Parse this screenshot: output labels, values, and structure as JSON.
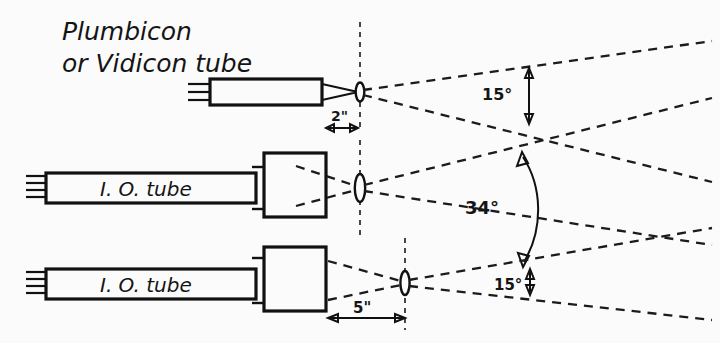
{
  "figure": {
    "type": "optical-ray-diagram",
    "background_color": "#fbfbfb",
    "ink_color": "#111111",
    "title_lines": {
      "line1": "Plumbicon",
      "line2": "or Vidicon tube"
    }
  },
  "labels": {
    "io_tube_middle": "I. O. tube",
    "io_tube_bottom": "I. O. tube"
  },
  "dimensions": [
    {
      "id": "dim-2in",
      "text": "2\"",
      "value": 2,
      "unit": "inch",
      "orientation": "horizontal"
    },
    {
      "id": "dim-5in",
      "text": "5\"",
      "value": 5,
      "unit": "inch",
      "orientation": "horizontal"
    }
  ],
  "angles": [
    {
      "id": "angle-top",
      "text": "15°",
      "value": 15,
      "unit": "degree",
      "arrow": "straight-double"
    },
    {
      "id": "angle-middle",
      "text": "34°",
      "value": 34,
      "unit": "degree",
      "arrow": "curved-double"
    },
    {
      "id": "angle-bottom",
      "text": "15°",
      "value": 15,
      "unit": "degree",
      "arrow": "straight-double"
    }
  ],
  "components": [
    {
      "id": "tube-top",
      "kind": "camera-tube",
      "variant": "slim",
      "pin_count": 3,
      "label": "Plumbicon or Vidicon tube"
    },
    {
      "id": "tube-middle",
      "kind": "camera-tube",
      "variant": "image-orthicon",
      "pin_count": 4,
      "label": "I. O. tube"
    },
    {
      "id": "tube-bottom",
      "kind": "camera-tube",
      "variant": "image-orthicon",
      "pin_count": 4,
      "label": "I. O. tube"
    },
    {
      "id": "lens-top",
      "kind": "lens",
      "size": "small"
    },
    {
      "id": "lens-middle",
      "kind": "lens",
      "size": "large"
    },
    {
      "id": "lens-bottom",
      "kind": "lens",
      "size": "medium"
    }
  ]
}
